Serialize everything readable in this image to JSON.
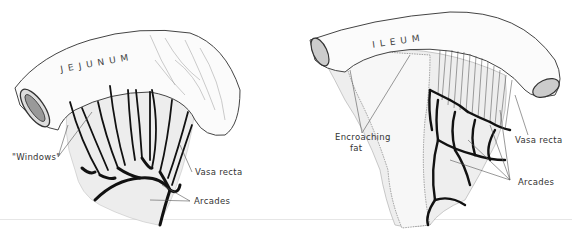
{
  "figure": {
    "panels": [
      {
        "id": "jejunum",
        "title": "JEJUNUM",
        "labels": {
          "windows": "\"Windows\"",
          "vasa_recta": "Vasa recta",
          "arcades": "Arcades"
        }
      },
      {
        "id": "ileum",
        "title": "ILEUM",
        "labels": {
          "encroaching_fat_line1": "Encroaching",
          "encroaching_fat_line2": "fat",
          "vasa_recta": "Vasa recta",
          "arcades": "Arcades"
        }
      }
    ],
    "colors": {
      "ink": "#111111",
      "outline": "#555555",
      "mesentery": "#ececec",
      "background": "#ffffff"
    }
  }
}
